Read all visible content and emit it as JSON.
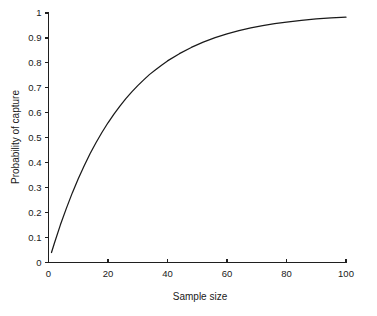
{
  "chart_data": {
    "type": "line",
    "title": "",
    "xlabel": "Sample size",
    "ylabel": "Probability of capture",
    "xlim": [
      0,
      100
    ],
    "ylim": [
      0,
      1
    ],
    "grid": false,
    "legend": null,
    "x_ticks": [
      "0",
      "20",
      "40",
      "60",
      "80",
      "100"
    ],
    "x_tick_values": [
      0,
      20,
      40,
      60,
      80,
      100
    ],
    "y_ticks": [
      "0",
      "0.1",
      "0.2",
      "0.3",
      "0.4",
      "0.5",
      "0.6",
      "0.7",
      "0.8",
      "0.9",
      "1"
    ],
    "y_tick_values": [
      0,
      0.1,
      0.2,
      0.3,
      0.4,
      0.5,
      0.6,
      0.7,
      0.8,
      0.9,
      1
    ],
    "series": [
      {
        "name": "Probability of capture",
        "color": "#1a1a1a",
        "x": [
          1,
          2,
          4,
          6,
          8,
          10,
          12,
          14,
          16,
          18,
          20,
          22,
          24,
          26,
          28,
          30,
          32,
          34,
          36,
          38,
          40,
          44,
          48,
          52,
          56,
          60,
          64,
          68,
          72,
          76,
          80,
          85,
          90,
          95,
          100
        ],
        "values": [
          0.04,
          0.078,
          0.151,
          0.217,
          0.279,
          0.336,
          0.388,
          0.437,
          0.481,
          0.522,
          0.56,
          0.595,
          0.627,
          0.657,
          0.684,
          0.709,
          0.732,
          0.754,
          0.773,
          0.791,
          0.808,
          0.837,
          0.862,
          0.883,
          0.901,
          0.916,
          0.929,
          0.94,
          0.949,
          0.957,
          0.963,
          0.97,
          0.976,
          0.98,
          0.983
        ]
      }
    ]
  },
  "axes": {
    "y_title": "Probability of capture",
    "x_title": "Sample size"
  }
}
